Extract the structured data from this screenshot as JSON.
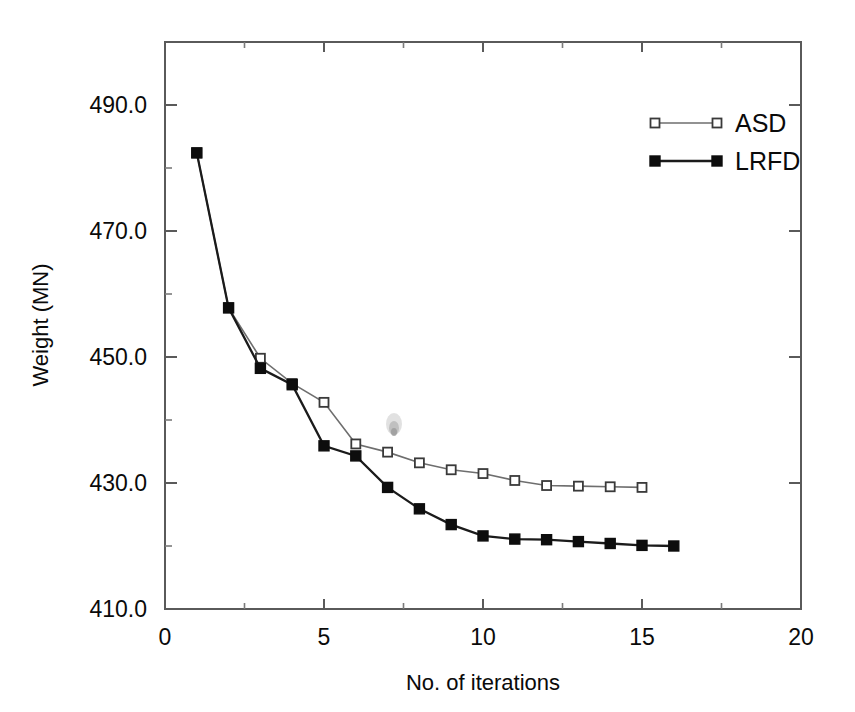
{
  "chart_data": {
    "type": "line",
    "title": "",
    "xlabel": "No. of iterations",
    "ylabel": "Weight (MN)",
    "xlim": [
      0,
      20
    ],
    "ylim": [
      410.0,
      495.0
    ],
    "grid": false,
    "legend_position": "top-right",
    "x_ticks": [
      0,
      5,
      10,
      15,
      20
    ],
    "x_tick_labels": [
      "0",
      "5",
      "10",
      "15",
      "20"
    ],
    "x_minor_interval": 2.5,
    "y_ticks": [
      410.0,
      430.0,
      450.0,
      470.0,
      490.0
    ],
    "y_tick_labels": [
      "410.0",
      "430.0",
      "450.0",
      "470.0",
      "490.0"
    ],
    "y_minor_interval": 10.0,
    "series": [
      {
        "name": "ASD",
        "marker": "open-square",
        "color": "#6e6e6e",
        "x": [
          1,
          2,
          3,
          4,
          5,
          6,
          7,
          8,
          9,
          10,
          11,
          12,
          13,
          14,
          15
        ],
        "values": [
          482.4,
          457.8,
          449.8,
          445.8,
          442.8,
          436.2,
          434.9,
          433.2,
          432.1,
          431.5,
          430.4,
          429.6,
          429.5,
          429.4,
          429.3
        ]
      },
      {
        "name": "LRFD",
        "marker": "filled-square",
        "color": "#0d0d0d",
        "x": [
          1,
          2,
          3,
          4,
          5,
          6,
          7,
          8,
          9,
          10,
          11,
          12,
          13,
          14,
          15,
          16
        ],
        "values": [
          482.4,
          457.8,
          448.2,
          445.6,
          435.9,
          434.3,
          429.3,
          425.9,
          423.4,
          421.6,
          421.1,
          421.0,
          420.7,
          420.4,
          420.1,
          420.0
        ]
      }
    ]
  },
  "legend": {
    "entries": [
      {
        "label": "ASD"
      },
      {
        "label": "LRFD"
      }
    ]
  },
  "axes": {
    "x_title": "No. of iterations",
    "y_title": "Weight (MN)"
  }
}
